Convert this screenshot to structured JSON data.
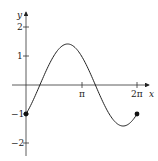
{
  "chart_data": {
    "type": "line",
    "title": "",
    "xlabel": "x",
    "ylabel": "y",
    "function": "sin x - cos x",
    "xlim": [
      0,
      6.2832
    ],
    "ylim": [
      -2,
      2
    ],
    "grid": false,
    "x_ticks": [
      {
        "value": 3.1416,
        "label": "π"
      },
      {
        "value": 6.2832,
        "label": "2π"
      }
    ],
    "y_ticks": [
      {
        "value": 2,
        "label": "2"
      },
      {
        "value": 1,
        "label": "1"
      },
      {
        "value": -1,
        "label": "-1"
      },
      {
        "value": -2,
        "label": "-2"
      }
    ],
    "series": [
      {
        "name": "f(x)",
        "x": [
          0,
          0.7854,
          2.3562,
          3.927,
          5.4978,
          6.2832
        ],
        "y": [
          -1,
          0,
          1.414,
          0,
          -1.414,
          -1
        ]
      }
    ],
    "endpoints": [
      {
        "x": 0,
        "y": -1,
        "filled": true
      },
      {
        "x": 6.2832,
        "y": -1,
        "filled": true
      }
    ],
    "colors": {
      "axis": "#333333",
      "curve": "#222222"
    }
  },
  "labels": {
    "x_axis": "x",
    "y_axis": "y",
    "x_tick_pi": "π",
    "x_tick_2pi": "2π",
    "y_tick_2": "2",
    "y_tick_1": "1",
    "y_tick_m1": "−1",
    "y_tick_m2": "−2"
  }
}
